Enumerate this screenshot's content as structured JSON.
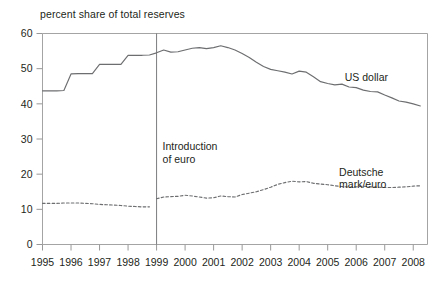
{
  "chart_data": {
    "type": "line",
    "title": "percent share of total reserves",
    "xlabel": "",
    "ylabel": "percent share of total reserves",
    "ylim": [
      0,
      60
    ],
    "xlim": [
      1995,
      2008.5
    ],
    "yticks": [
      "0",
      "10",
      "20",
      "30",
      "40",
      "50",
      "60"
    ],
    "ytick_values": [
      0,
      10,
      20,
      30,
      40,
      50,
      60
    ],
    "xticks": [
      "1995",
      "1996",
      "1997",
      "1998",
      "1999",
      "2000",
      "2001",
      "2002",
      "2003",
      "2004",
      "2005",
      "2006",
      "2007",
      "2008"
    ],
    "xtick_values": [
      1995,
      1996,
      1997,
      1998,
      1999,
      2000,
      2001,
      2002,
      2003,
      2004,
      2005,
      2006,
      2007,
      2008
    ],
    "grid": false,
    "legend_position": "inline-right",
    "annotations": [
      {
        "name": "introduction-of-euro",
        "text_line1": "Introduction",
        "text_line2": "of euro",
        "x": 1999,
        "type": "vertical-line-with-label"
      }
    ],
    "series": [
      {
        "name": "US dollar",
        "label": "US dollar",
        "style": "solid",
        "color": "#6d6e70",
        "label_x": 2005.6,
        "label_y": 46.6,
        "x": [
          1995.0,
          1995.25,
          1995.5,
          1995.75,
          1996.0,
          1996.25,
          1996.5,
          1996.75,
          1997.0,
          1997.25,
          1997.5,
          1997.75,
          1998.0,
          1998.25,
          1998.5,
          1998.75,
          1999.0,
          1999.25,
          1999.5,
          1999.75,
          2000.0,
          2000.25,
          2000.5,
          2000.75,
          2001.0,
          2001.25,
          2001.5,
          2001.75,
          2002.0,
          2002.25,
          2002.5,
          2002.75,
          2003.0,
          2003.25,
          2003.5,
          2003.75,
          2004.0,
          2004.25,
          2004.5,
          2004.75,
          2005.0,
          2005.25,
          2005.5,
          2005.75,
          2006.0,
          2006.25,
          2006.5,
          2006.75,
          2007.0,
          2007.25,
          2007.5,
          2007.75,
          2008.0,
          2008.25
        ],
        "y": [
          43.7,
          43.7,
          43.7,
          43.8,
          48.5,
          48.6,
          48.6,
          48.6,
          51.2,
          51.2,
          51.2,
          51.2,
          53.8,
          53.8,
          53.8,
          53.9,
          54.5,
          55.3,
          54.7,
          54.8,
          55.3,
          55.8,
          56.0,
          55.7,
          56.0,
          56.5,
          56.0,
          55.3,
          54.3,
          53.2,
          51.8,
          50.6,
          49.8,
          49.4,
          49.0,
          48.5,
          49.3,
          49.0,
          47.7,
          46.3,
          45.8,
          45.4,
          45.6,
          44.8,
          44.6,
          43.9,
          43.5,
          43.4,
          42.5,
          41.7,
          40.8,
          40.5,
          40.0,
          39.4
        ]
      },
      {
        "name": "Deutsche mark/euro",
        "label_line1": "Deutsche",
        "label_line2": "mark/euro",
        "style": "dashed",
        "color": "#6d6e70",
        "label_x": 2005.4,
        "label_y": 19.5,
        "x": [
          1995.0,
          1995.25,
          1995.5,
          1995.75,
          1996.0,
          1996.25,
          1996.5,
          1996.75,
          1997.0,
          1997.25,
          1997.5,
          1997.75,
          1998.0,
          1998.25,
          1998.5,
          1998.75
        ],
        "y": [
          11.7,
          11.7,
          11.7,
          11.8,
          11.8,
          11.8,
          11.7,
          11.6,
          11.4,
          11.3,
          11.2,
          11.1,
          10.9,
          10.8,
          10.7,
          10.7
        ],
        "x2": [
          1999.0,
          1999.25,
          1999.5,
          1999.75,
          2000.0,
          2000.25,
          2000.5,
          2000.75,
          2001.0,
          2001.25,
          2001.5,
          2001.75,
          2002.0,
          2002.25,
          2002.5,
          2002.75,
          2003.0,
          2003.25,
          2003.5,
          2003.75,
          2004.0,
          2004.25,
          2004.5,
          2004.75,
          2005.0,
          2005.25,
          2005.5,
          2005.75,
          2006.0,
          2006.25,
          2006.5,
          2006.75,
          2007.0,
          2007.25,
          2007.5,
          2007.75,
          2008.0,
          2008.25
        ],
        "y2": [
          13.0,
          13.5,
          13.6,
          13.7,
          14.0,
          13.8,
          13.5,
          13.2,
          13.3,
          13.8,
          13.6,
          13.5,
          14.2,
          14.6,
          15.0,
          15.6,
          16.3,
          17.1,
          17.6,
          18.0,
          17.8,
          17.9,
          17.4,
          17.2,
          17.0,
          16.7,
          16.5,
          16.3,
          16.4,
          16.6,
          16.4,
          16.3,
          16.2,
          16.2,
          16.3,
          16.4,
          16.6,
          16.7
        ]
      }
    ]
  }
}
